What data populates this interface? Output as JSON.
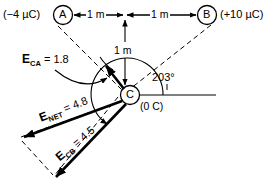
{
  "figure": {
    "type": "physics-vector-diagram"
  },
  "charges": {
    "a": {
      "node": "A",
      "value": "(−4 µC)"
    },
    "b": {
      "node": "B",
      "value": "(+10 µC)"
    },
    "c": {
      "node": "C",
      "value": "(0 C)"
    }
  },
  "dimensions": {
    "left_span": "1 m",
    "right_span": "1 m",
    "vertical_span": "1 m"
  },
  "angle": {
    "value": "203°"
  },
  "vectors": {
    "eca": {
      "symbol": "E",
      "sub": "CA",
      "eq": "= 1.8"
    },
    "enet": {
      "symbol": "E",
      "sub": "NET",
      "eq": "= 4.8"
    },
    "ecb": {
      "symbol": "E",
      "sub": "CB",
      "eq": "= 4.5"
    }
  },
  "colors": {
    "ink": "#000000",
    "background": "#ffffff"
  }
}
